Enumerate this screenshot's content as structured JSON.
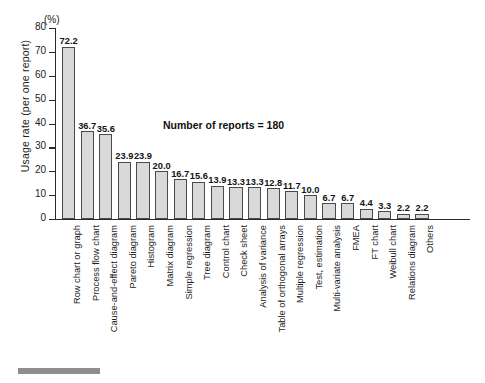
{
  "chart_data": {
    "type": "bar",
    "title": "",
    "xlabel": "",
    "ylabel": "Usage rate (per one report)",
    "yunit": "(%)",
    "ylim": [
      0,
      80
    ],
    "yticks": [
      0,
      10,
      20,
      30,
      40,
      50,
      60,
      70,
      80
    ],
    "grid": false,
    "legend": false,
    "annotation": "Number of reports = 180",
    "bar_color": "#d9d9d9",
    "bar_edge_color": "#4a4a4a",
    "categories": [
      "Row chart or graph",
      "Process flow chart",
      "Cause-and-effect diagram",
      "Pareto diagram",
      "Histogram",
      "Matrix diagram",
      "Simple regression",
      "Tree diagram",
      "Control chart",
      "Check sheet",
      "Analysis of variance",
      "Table of orthogonal arrays",
      "Multiple regression",
      "Test, estimation",
      "Multi-variate analysis",
      "FMEA",
      "FT chart",
      "Weibull chart",
      "Relations diagram",
      "Others"
    ],
    "values": [
      72.2,
      36.7,
      35.6,
      23.9,
      23.9,
      20.0,
      16.7,
      15.6,
      13.9,
      13.3,
      13.3,
      12.8,
      11.7,
      10.0,
      6.7,
      6.7,
      4.4,
      3.3,
      2.2,
      2.2
    ],
    "value_labels": [
      "72.2",
      "36.7",
      "35.6",
      "23.9",
      "23.9",
      "20.0",
      "16.7",
      "15.6",
      "13.9",
      "13.3",
      "13.3",
      "12.8",
      "11.7",
      "10.0",
      "6.7",
      "6.7",
      "4.4",
      "3.3",
      "2.2",
      "2.2"
    ],
    "ytick_labels": [
      "0",
      "10",
      "20",
      "30",
      "40",
      "50",
      "60",
      "70",
      "80"
    ]
  }
}
